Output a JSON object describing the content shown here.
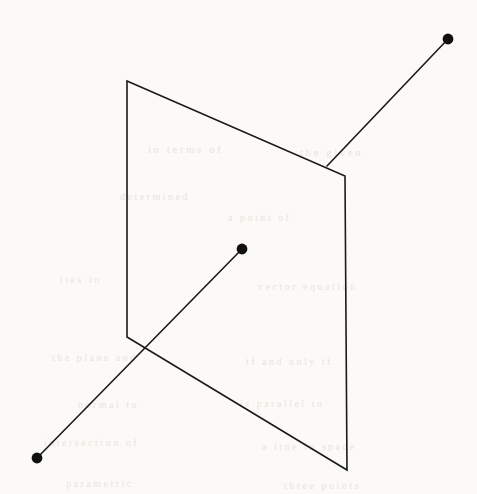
{
  "figure": {
    "background_color": "#fbfaf7",
    "stroke_color": "#1a1a1a",
    "stroke_width": 1.6,
    "dot_color": "#101010",
    "canvas": {
      "width": 477,
      "height": 494
    }
  },
  "chart_data": {
    "type": "scatter",
    "xlabel": "",
    "ylabel": "",
    "xlim": [
      0,
      477
    ],
    "ylim": [
      0,
      494
    ],
    "grid": false,
    "legend": "none",
    "shapes": [
      {
        "name": "plane-quadrilateral",
        "kind": "polygon",
        "closed": true,
        "fill": "none",
        "stroke": "#1a1a1a",
        "points": [
          [
            127,
            81
          ],
          [
            345,
            176
          ],
          [
            347,
            470
          ],
          [
            127,
            337
          ]
        ],
        "path": "M 127 81 L 345 176 L 347 470 L 127 337 Z"
      },
      {
        "name": "upper-ray-segment",
        "kind": "polyline",
        "closed": false,
        "stroke": "#1a1a1a",
        "points": [
          [
            448,
            39
          ],
          [
            327,
            166
          ]
        ],
        "path": "M 448 39 L 327 166"
      },
      {
        "name": "lower-ray-segment",
        "kind": "polyline",
        "closed": false,
        "stroke": "#1a1a1a",
        "points": [
          [
            37,
            458
          ],
          [
            242,
            249
          ]
        ],
        "path": "M 37 458 L 242 249"
      }
    ],
    "points": [
      {
        "name": "upper-right-endpoint",
        "x": 448,
        "y": 39,
        "r": 5.4,
        "color": "#101010"
      },
      {
        "name": "center-endpoint",
        "x": 242,
        "y": 249,
        "r": 5.4,
        "color": "#101010"
      },
      {
        "name": "lower-left-endpoint",
        "x": 37,
        "y": 458,
        "r": 5.4,
        "color": "#101010"
      }
    ],
    "intersections": [
      {
        "name": "piercing-point-top-edge",
        "x": 327,
        "y": 166
      },
      {
        "name": "crossing-point-bottom-edge",
        "x": 142,
        "y": 348
      }
    ],
    "vertices": [
      {
        "name": "top-left-vertex",
        "x": 127,
        "y": 81
      },
      {
        "name": "top-right-vertex",
        "x": 345,
        "y": 176
      },
      {
        "name": "bottom-right-vertex",
        "x": 347,
        "y": 470
      },
      {
        "name": "bottom-left-vertex",
        "x": 127,
        "y": 337
      }
    ]
  },
  "ghost_text": {
    "lines": [
      {
        "text": "in terms of",
        "x": 148,
        "y": 143,
        "size": 11,
        "rotate": 0
      },
      {
        "text": "the given",
        "x": 300,
        "y": 146,
        "size": 11,
        "rotate": 0
      },
      {
        "text": "determined",
        "x": 120,
        "y": 191,
        "size": 10,
        "rotate": 0
      },
      {
        "text": "a point of",
        "x": 228,
        "y": 212,
        "size": 10,
        "rotate": 0
      },
      {
        "text": "lies in",
        "x": 60,
        "y": 274,
        "size": 10,
        "rotate": 0
      },
      {
        "text": "vector equation",
        "x": 258,
        "y": 281,
        "size": 10,
        "rotate": 0
      },
      {
        "text": "the plane and",
        "x": 52,
        "y": 352,
        "size": 10,
        "rotate": 0
      },
      {
        "text": "if and only if",
        "x": 246,
        "y": 356,
        "size": 10,
        "rotate": 0
      },
      {
        "text": "normal to",
        "x": 78,
        "y": 399,
        "size": 10,
        "rotate": 0
      },
      {
        "text": "is parallel to",
        "x": 240,
        "y": 398,
        "size": 10,
        "rotate": 0
      },
      {
        "text": "intersection of",
        "x": 44,
        "y": 437,
        "size": 10,
        "rotate": 0
      },
      {
        "text": "a line in space",
        "x": 262,
        "y": 441,
        "size": 10,
        "rotate": 0
      },
      {
        "text": "parametric",
        "x": 66,
        "y": 478,
        "size": 10,
        "rotate": 0
      },
      {
        "text": "three points",
        "x": 284,
        "y": 480,
        "size": 10,
        "rotate": 0
      }
    ]
  }
}
